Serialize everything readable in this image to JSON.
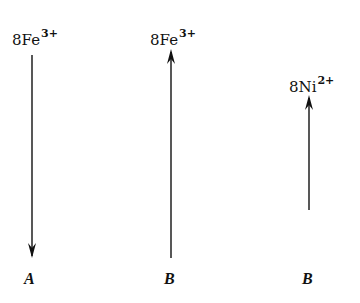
{
  "diagram": {
    "columns": [
      {
        "id": "col-1",
        "species": "8Fe",
        "charge": "3+",
        "direction": "down",
        "footer": "A"
      },
      {
        "id": "col-2",
        "species": "8Fe",
        "charge": "3+",
        "direction": "up",
        "footer": "B"
      },
      {
        "id": "col-3",
        "species": "8Ni",
        "charge": "2+",
        "direction": "up",
        "footer": "B"
      }
    ],
    "colors": {
      "ink": "#111111",
      "background": "#ffffff"
    }
  }
}
